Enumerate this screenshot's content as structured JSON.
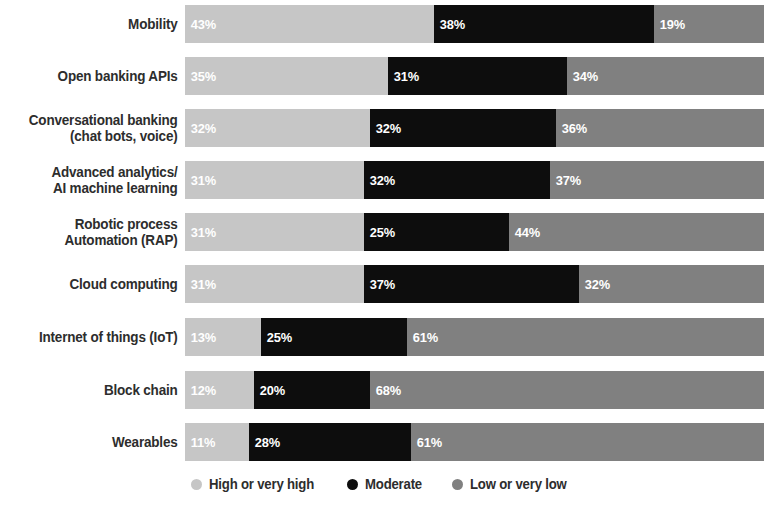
{
  "chart_data": {
    "type": "bar",
    "subtype": "stacked-horizontal-100",
    "title": "",
    "subtitle": "",
    "xlabel": "",
    "ylabel": "",
    "xlim": [
      0,
      100
    ],
    "grid": false,
    "legend_position": "bottom-center",
    "value_suffix": "%",
    "categories": [
      "Mobility",
      "Open banking APIs",
      "Conversational banking\n(chat bots, voice)",
      "Advanced analytics/\nAI machine learning",
      "Robotic process\nAutomation (RAP)",
      "Cloud computing",
      "Internet of things (IoT)",
      "Block chain",
      "Wearables"
    ],
    "series": [
      {
        "name": "High or very high",
        "color": "#c6c6c6",
        "values": [
          43,
          35,
          32,
          31,
          31,
          31,
          13,
          12,
          11
        ]
      },
      {
        "name": "Moderate",
        "color": "#0d0d0d",
        "values": [
          38,
          31,
          32,
          32,
          25,
          37,
          25,
          20,
          28
        ]
      },
      {
        "name": "Low or very low",
        "color": "#808080",
        "values": [
          19,
          34,
          36,
          37,
          44,
          32,
          61,
          68,
          61
        ]
      }
    ],
    "labels": {
      "Mobility": [
        "43%",
        "38%",
        "19%"
      ],
      "Open banking APIs": [
        "35%",
        "31%",
        "34%"
      ],
      "Conversational banking (chat bots, voice)": [
        "32%",
        "32%",
        "36%"
      ],
      "Advanced analytics/ AI machine learning": [
        "31%",
        "32%",
        "37%"
      ],
      "Robotic process Automation (RAP)": [
        "31%",
        "25%",
        "44%"
      ],
      "Cloud computing": [
        "31%",
        "37%",
        "32%"
      ],
      "Internet of things (IoT)": [
        "13%",
        "25%",
        "61%"
      ],
      "Block chain": [
        "12%",
        "20%",
        "68%"
      ],
      "Wearables": [
        "11%",
        "28%",
        "61%"
      ]
    }
  },
  "rows": [
    {
      "label": "Mobility",
      "top": 5,
      "height": 38,
      "segments": [
        {
          "series": "High or very high",
          "value": 43,
          "text": "43%",
          "variant": "high"
        },
        {
          "series": "Moderate",
          "value": 38,
          "text": "38%",
          "variant": "mod"
        },
        {
          "series": "Low or very low",
          "value": 19,
          "text": "19%",
          "variant": "low"
        }
      ]
    },
    {
      "label": "Open banking APIs",
      "top": 57,
      "height": 38,
      "segments": [
        {
          "series": "High or very high",
          "value": 35,
          "text": "35%",
          "variant": "high"
        },
        {
          "series": "Moderate",
          "value": 31,
          "text": "31%",
          "variant": "mod"
        },
        {
          "series": "Low or very low",
          "value": 34,
          "text": "34%",
          "variant": "low"
        }
      ]
    },
    {
      "label": "Conversational banking\n(chat bots, voice)",
      "top": 109,
      "height": 38,
      "segments": [
        {
          "series": "High or very high",
          "value": 32,
          "text": "32%",
          "variant": "high"
        },
        {
          "series": "Moderate",
          "value": 32,
          "text": "32%",
          "variant": "mod"
        },
        {
          "series": "Low or very low",
          "value": 36,
          "text": "36%",
          "variant": "low"
        }
      ]
    },
    {
      "label": "Advanced analytics/\nAI machine learning",
      "top": 161,
      "height": 38,
      "segments": [
        {
          "series": "High or very high",
          "value": 31,
          "text": "31%",
          "variant": "high"
        },
        {
          "series": "Moderate",
          "value": 32,
          "text": "32%",
          "variant": "mod"
        },
        {
          "series": "Low or very low",
          "value": 37,
          "text": "37%",
          "variant": "low"
        }
      ]
    },
    {
      "label": "Robotic process\nAutomation (RAP)",
      "top": 213,
      "height": 38,
      "segments": [
        {
          "series": "High or very high",
          "value": 31,
          "text": "31%",
          "variant": "high"
        },
        {
          "series": "Moderate",
          "value": 25,
          "text": "25%",
          "variant": "mod"
        },
        {
          "series": "Low or very low",
          "value": 44,
          "text": "44%",
          "variant": "low"
        }
      ]
    },
    {
      "label": "Cloud computing",
      "top": 265,
      "height": 38,
      "segments": [
        {
          "series": "High or very high",
          "value": 31,
          "text": "31%",
          "variant": "high"
        },
        {
          "series": "Moderate",
          "value": 37,
          "text": "37%",
          "variant": "mod"
        },
        {
          "series": "Low or very low",
          "value": 32,
          "text": "32%",
          "variant": "low"
        }
      ]
    },
    {
      "label": "Internet of things (IoT)",
      "top": 318,
      "height": 38,
      "segments": [
        {
          "series": "High or very high",
          "value": 13,
          "text": "13%",
          "variant": "high"
        },
        {
          "series": "Moderate",
          "value": 25,
          "text": "25%",
          "variant": "mod"
        },
        {
          "series": "Low or very low",
          "value": 61,
          "text": "61%",
          "variant": "low"
        }
      ]
    },
    {
      "label": "Block chain",
      "top": 371,
      "height": 38,
      "segments": [
        {
          "series": "High or very high",
          "value": 12,
          "text": "12%",
          "variant": "high"
        },
        {
          "series": "Moderate",
          "value": 20,
          "text": "20%",
          "variant": "mod"
        },
        {
          "series": "Low or very low",
          "value": 68,
          "text": "68%",
          "variant": "low"
        }
      ]
    },
    {
      "label": "Wearables",
      "top": 423,
      "height": 38,
      "segments": [
        {
          "series": "High or very high",
          "value": 11,
          "text": "11%",
          "variant": "high"
        },
        {
          "series": "Moderate",
          "value": 28,
          "text": "28%",
          "variant": "mod"
        },
        {
          "series": "Low or very low",
          "value": 61,
          "text": "61%",
          "variant": "low"
        }
      ]
    }
  ],
  "legend": {
    "items": [
      {
        "label": "High or very high",
        "color": "#c6c6c6"
      },
      {
        "label": "Moderate",
        "color": "#0d0d0d"
      },
      {
        "label": "Low or very low",
        "color": "#808080"
      }
    ]
  }
}
